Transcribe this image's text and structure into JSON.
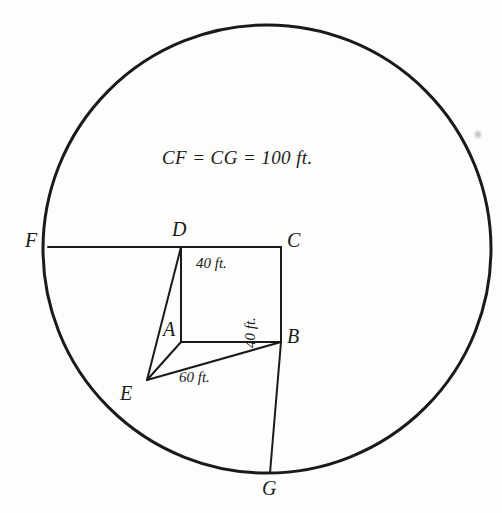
{
  "figure": {
    "title_caption": "CF = CG = 100 ft.",
    "background_color": "#fdfdfc",
    "ink_color": "#1a1a1a",
    "canvas": {
      "width": 502,
      "height": 513
    },
    "circle": {
      "name": "main-circle",
      "center_x": 267,
      "center_y": 249,
      "radius": 224,
      "stroke_width": 3
    },
    "points": [
      {
        "id": "A",
        "label": "A",
        "x": 181,
        "y": 342,
        "label_x": 163,
        "label_y": 319
      },
      {
        "id": "B",
        "label": "B",
        "x": 281,
        "y": 342,
        "label_x": 287,
        "label_y": 326
      },
      {
        "id": "C",
        "label": "C",
        "x": 281,
        "y": 247,
        "label_x": 287,
        "label_y": 230
      },
      {
        "id": "D",
        "label": "D",
        "x": 181,
        "y": 247,
        "label_x": 172,
        "label_y": 219
      },
      {
        "id": "E",
        "label": "E",
        "x": 147,
        "y": 380,
        "label_x": 120,
        "label_y": 383
      },
      {
        "id": "F",
        "label": "F",
        "x": 48,
        "y": 247,
        "label_x": 25,
        "label_y": 230
      },
      {
        "id": "G",
        "label": "G",
        "x": 270,
        "y": 473,
        "label_x": 262,
        "label_y": 478
      }
    ],
    "segments": [
      {
        "name": "segment-FD",
        "from": "F",
        "to": "D"
      },
      {
        "name": "segment-DC",
        "from": "D",
        "to": "C"
      },
      {
        "name": "segment-CB",
        "from": "C",
        "to": "B"
      },
      {
        "name": "segment-BA",
        "from": "B",
        "to": "A"
      },
      {
        "name": "segment-AD",
        "from": "A",
        "to": "D"
      },
      {
        "name": "segment-ED",
        "from": "E",
        "to": "D"
      },
      {
        "name": "segment-EA",
        "from": "E",
        "to": "A"
      },
      {
        "name": "segment-EB",
        "from": "E",
        "to": "B"
      },
      {
        "name": "segment-BG",
        "from": "B",
        "to": "G"
      }
    ],
    "dimensions": [
      {
        "id": "dc-length",
        "text": "40 ft.",
        "x": 196,
        "y": 256,
        "rotated": false
      },
      {
        "id": "cb-length",
        "text": "40 ft.",
        "x": 258,
        "y": 333,
        "rotated": true
      },
      {
        "id": "eb-length",
        "text": "60 ft.",
        "x": 179,
        "y": 370,
        "rotated": false
      }
    ],
    "caption": {
      "x": 162,
      "y": 148
    },
    "artifact": {
      "x": 475,
      "y": 131
    }
  }
}
